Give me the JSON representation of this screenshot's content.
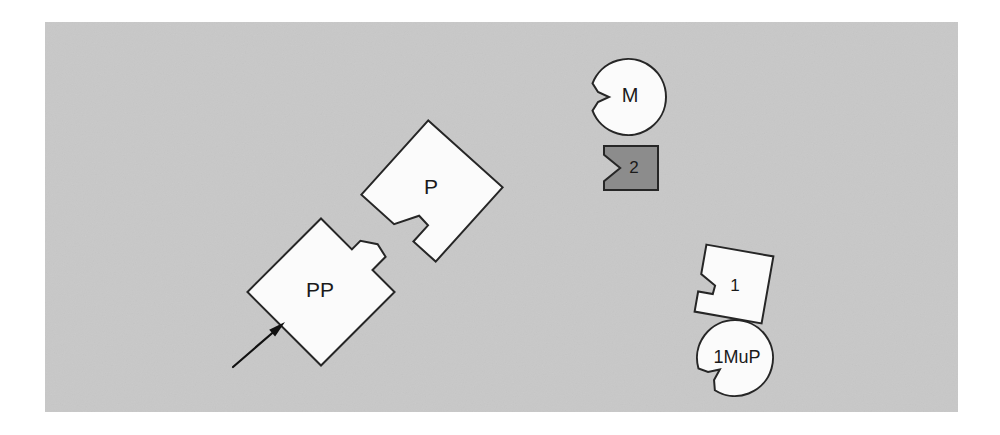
{
  "figure": {
    "background_color": "#ffffff",
    "panel": {
      "name": "diagram-panel",
      "fill": "#c8c8c8",
      "x": 45,
      "y": 22,
      "width": 913,
      "height": 390
    },
    "stroke_color": "#262626",
    "shape_fill_light": "#fbfbfb",
    "shape_fill_dark": "#8c8c8c",
    "arrow_color": "#111111"
  },
  "shapes": [
    {
      "id": "shape-m",
      "label": "M",
      "kind": "notched-circle",
      "fill": "#fbfbfb",
      "center_x": 628,
      "center_y": 97,
      "radius": 38,
      "notch_angle_deg": 180,
      "label_x": 630,
      "label_y": 97,
      "font_size": 20
    },
    {
      "id": "shape-2",
      "label": "2",
      "kind": "notched-rectangle",
      "fill": "#8c8c8c",
      "x": 604,
      "y": 146,
      "width": 54,
      "height": 44,
      "notch_side": "left",
      "label_x": 634,
      "label_y": 169,
      "font_size": 17
    },
    {
      "id": "shape-p",
      "label": "P",
      "kind": "notched-square-in",
      "fill": "#fbfbfb",
      "center_x": 432,
      "center_y": 191,
      "half": 50,
      "rotation_deg": 42,
      "notch_edge": "lower-left",
      "label_x": 431,
      "label_y": 188,
      "font_size": 21
    },
    {
      "id": "shape-pp",
      "label": "PP",
      "kind": "tabbed-square-out",
      "fill": "#fbfbfb",
      "center_x": 321,
      "center_y": 292,
      "half": 52,
      "rotation_deg": 45,
      "tab_edge": "upper-right",
      "label_x": 320,
      "label_y": 291,
      "font_size": 21
    },
    {
      "id": "shape-1",
      "label": "1",
      "kind": "notched-square-in",
      "fill": "#fbfbfb",
      "center_x": 734,
      "center_y": 284,
      "half": 34,
      "rotation_deg": 10,
      "notch_edge": "upper-left",
      "label_x": 735,
      "label_y": 287,
      "font_size": 17
    },
    {
      "id": "shape-1mup",
      "label": "1MuP",
      "kind": "notched-circle",
      "fill": "#fbfbfb",
      "center_x": 735,
      "center_y": 358,
      "radius": 38,
      "notch_angle_deg": 143,
      "label_x": 737,
      "label_y": 358,
      "font_size": 18
    }
  ],
  "arrow": {
    "id": "pointer-arrow",
    "from_x": 233,
    "from_y": 367,
    "to_x": 285,
    "to_y": 322,
    "color": "#111111",
    "line_width": 2.2,
    "head_length": 17,
    "head_width": 9
  }
}
